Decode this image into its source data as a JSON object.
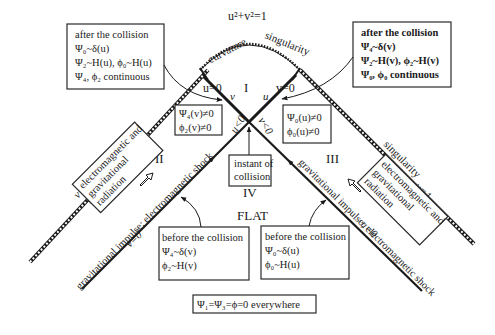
{
  "arc": {
    "equation": "u²+v²=1",
    "label_left": "curvature",
    "label_right": "singularity"
  },
  "regions": {
    "I": "I",
    "II": "II",
    "III": "III",
    "IV": "IV",
    "flat": "FLAT"
  },
  "center_labels": {
    "u0": "u=0",
    "v0": "v=0",
    "v_axis": "v",
    "u_axis": "u",
    "u_neg": "u<0",
    "v_neg": "v<0"
  },
  "instant_box": {
    "line1": "instant of",
    "line2": "collision"
  },
  "left_after_box": {
    "line1": "after the collision",
    "line2": "Ψ₀~δ(u)",
    "line3": "Ψ₂~H(u), ϕ₀~H(u)",
    "line4": "Ψ₄, ϕ₂ continuous"
  },
  "right_after_box": {
    "line1": "after the collision",
    "line2": "Ψ₄~δ(v)",
    "line3": "Ψ₂~H(v), ϕ₂~H(v)",
    "line4": "Ψ₀, ϕ₀ continuous"
  },
  "left_inner_box": {
    "line1": "Ψ₄(v)≠0",
    "line2": "ϕ₂(v)≠0"
  },
  "right_inner_box": {
    "line1": "Ψ₀(u)≠0",
    "line2": "ϕ₀(u)≠0"
  },
  "left_before_box": {
    "line1": "before the collision",
    "line2": "Ψ₄~δ(v)",
    "line3": "ϕ₂~H(v)"
  },
  "right_before_box": {
    "line1": "before the collision",
    "line2": "Ψ₀~δ(u)",
    "line3": "ϕ₀~H(u)"
  },
  "left_singularity": {
    "label": "singularity",
    "coord": "v=1"
  },
  "right_singularity": {
    "label": "singularity",
    "coord": "u=1"
  },
  "left_wave": {
    "label": "gravitational impulse; electromagnetic shock",
    "coord": "v=0"
  },
  "right_wave": {
    "label": "gravitational impulse; electromagnetic shock",
    "coord": "u=0"
  },
  "radiation_box": {
    "line1": "electromagnetic and",
    "line2": "gravitational",
    "line3": "radiation"
  },
  "footer_box": {
    "text": "Ψ₁=Ψ₃=ϕ=0 everywhere"
  }
}
